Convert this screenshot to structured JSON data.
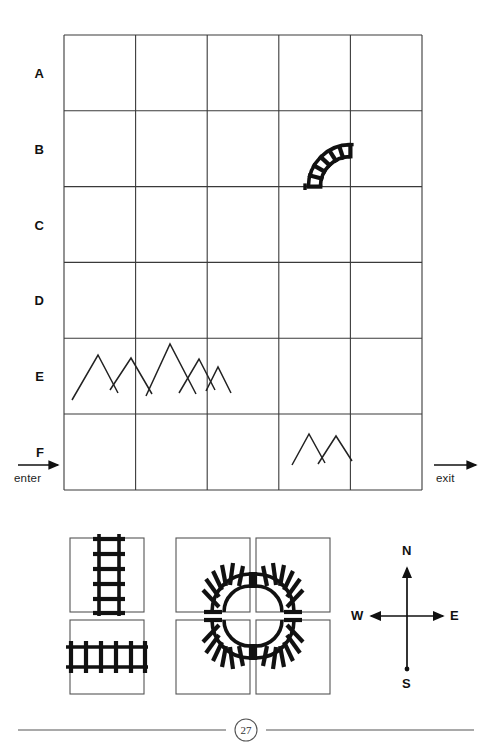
{
  "page": {
    "number": "27",
    "type": "puzzle-worksheet"
  },
  "grid": {
    "rows": [
      "A",
      "B",
      "C",
      "D",
      "E",
      "F"
    ],
    "columns": 5,
    "entrance": {
      "label": "enter",
      "side": "west",
      "row": "F",
      "icon": "arrow-right-icon"
    },
    "exit": {
      "label": "exit",
      "side": "east",
      "row": "F",
      "icon": "arrow-right-icon"
    },
    "contents": [
      {
        "cell": "B4",
        "type": "track-curve",
        "name": "curve-south-to-east",
        "from": "S",
        "to": "E"
      },
      {
        "cell": "E1-E2",
        "type": "mountains",
        "name": "mountain-range-large",
        "peaks": 5
      },
      {
        "cell": "F4",
        "type": "mountains",
        "name": "mountain-range-small",
        "peaks": 2
      }
    ]
  },
  "legend": {
    "straight_pieces": [
      {
        "name": "track-straight-vertical",
        "orientation": "vertical"
      },
      {
        "name": "track-straight-horizontal",
        "orientation": "horizontal"
      }
    ],
    "curve_pieces": [
      {
        "name": "track-curve-south-east",
        "from": "S",
        "to": "E"
      },
      {
        "name": "track-curve-south-west",
        "from": "S",
        "to": "W"
      },
      {
        "name": "track-curve-north-east",
        "from": "N",
        "to": "E"
      },
      {
        "name": "track-curve-north-west",
        "from": "N",
        "to": "W"
      }
    ]
  },
  "compass": {
    "north": "N",
    "south": "S",
    "east": "E",
    "west": "W"
  },
  "colors": {
    "ink": "#111111",
    "grid_line": "#3a3a3a",
    "rule": "#555555",
    "paper": "#ffffff"
  }
}
